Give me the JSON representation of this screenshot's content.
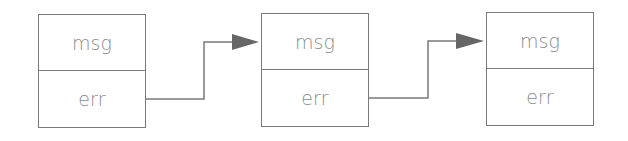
{
  "diagram": {
    "nodes": [
      {
        "id": "node-1",
        "fields": [
          "msg",
          "err"
        ]
      },
      {
        "id": "node-2",
        "fields": [
          "msg",
          "err"
        ]
      },
      {
        "id": "node-3",
        "fields": [
          "msg",
          "err"
        ]
      }
    ],
    "edges": [
      {
        "from": "node-1.err",
        "to": "node-2.msg"
      },
      {
        "from": "node-2.err",
        "to": "node-3.msg"
      }
    ],
    "colors": {
      "stroke": "#7a7a7a",
      "text": "#8a8a8a",
      "arrow": "#666666"
    }
  }
}
